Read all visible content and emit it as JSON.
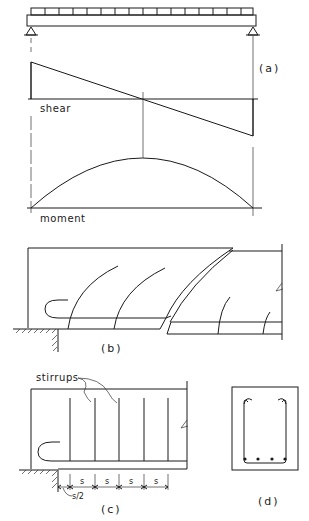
{
  "figure": {
    "panels": {
      "a": {
        "caption": "(a)",
        "beam": {
          "load_blocks": 16,
          "supports": [
            "pin-left",
            "pin-right"
          ],
          "load": "uniformly distributed"
        },
        "shear_label": "shear",
        "moment_label": "moment"
      },
      "b": {
        "caption": "(b)"
      },
      "c": {
        "caption": "(c)",
        "callout": "stirrups",
        "stirrup_count": 5,
        "spacing_labels": [
          "s",
          "s",
          "s",
          "s"
        ],
        "end_spacing_label": "s/2"
      },
      "d": {
        "caption": "(d)",
        "bar_count": 4
      }
    },
    "colors": {
      "ink": "#1a1a1a",
      "paper": "#ffffff"
    }
  }
}
